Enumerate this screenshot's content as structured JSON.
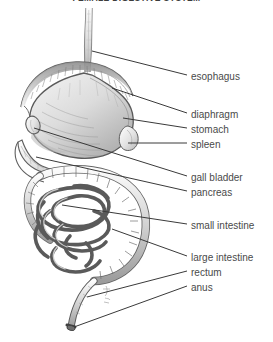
{
  "title": "FEMALE DIGESTIVE SYSTEM",
  "figure": {
    "alt_name": "digestive-system-diagram",
    "style": "pencil-shaded anatomical line drawing, grayscale",
    "ink_color": "#555555",
    "shade_color": "#9a9a9a",
    "background": "#ffffff"
  },
  "labels": [
    {
      "id": "esophagus",
      "text": "esophagus",
      "x": 191,
      "y": 78,
      "leader_from": [
        92,
        51
      ],
      "leader_to": [
        187,
        75
      ]
    },
    {
      "id": "diaphragm",
      "text": "diaphragm",
      "x": 191,
      "y": 116,
      "leader_from": [
        112,
        88
      ],
      "leader_to": [
        187,
        113
      ]
    },
    {
      "id": "stomach",
      "text": "stomach",
      "x": 191,
      "y": 131,
      "leader_from": [
        123,
        118
      ],
      "leader_to": [
        187,
        128
      ]
    },
    {
      "id": "spleen",
      "text": "spleen",
      "x": 191,
      "y": 146,
      "leader_from": [
        128,
        143
      ],
      "leader_to": [
        187,
        143
      ]
    },
    {
      "id": "gall-bladder",
      "text": "gall bladder",
      "x": 191,
      "y": 179,
      "leader_from": [
        34,
        128
      ],
      "leader_to": [
        187,
        176
      ]
    },
    {
      "id": "pancreas",
      "text": "pancreas",
      "x": 191,
      "y": 194,
      "leader_from": [
        36,
        157
      ],
      "leader_to": [
        187,
        191
      ]
    },
    {
      "id": "small-intestine",
      "text": "small intestine",
      "x": 191,
      "y": 227,
      "leader_from": [
        62,
        205
      ],
      "leader_to": [
        187,
        224
      ]
    },
    {
      "id": "large-intestine",
      "text": "large intestine",
      "x": 191,
      "y": 259,
      "leader_from": [
        112,
        229
      ],
      "leader_to": [
        187,
        256
      ]
    },
    {
      "id": "rectum",
      "text": "rectum",
      "x": 191,
      "y": 274,
      "leader_from": [
        87,
        297
      ],
      "leader_to": [
        187,
        271
      ]
    },
    {
      "id": "anus",
      "text": "anus",
      "x": 191,
      "y": 289,
      "leader_from": [
        74,
        327
      ],
      "leader_to": [
        187,
        286
      ]
    }
  ],
  "organs": [
    {
      "id": "esophagus",
      "name": "esophagus",
      "note": "narrow vertical tube descending from top of frame into stomach"
    },
    {
      "id": "diaphragm",
      "name": "diaphragm",
      "note": "wide shaded dome arc above the stomach"
    },
    {
      "id": "stomach",
      "name": "stomach",
      "note": "large shaded J-shaped sac below diaphragm"
    },
    {
      "id": "spleen",
      "name": "spleen",
      "note": "small oval at right of stomach"
    },
    {
      "id": "gall-bladder",
      "name": "gall bladder",
      "note": "small pear-shaped sac at upper left"
    },
    {
      "id": "pancreas",
      "name": "pancreas",
      "note": "elongated tapered gland behind stomach, left side"
    },
    {
      "id": "small-intestine",
      "name": "small intestine",
      "note": "dense tangled coils of narrow tubing in center"
    },
    {
      "id": "large-intestine",
      "name": "large intestine",
      "note": "wide haustrated tube framing the coils, right side"
    },
    {
      "id": "rectum",
      "name": "rectum",
      "note": "straight descending tube at bottom center"
    },
    {
      "id": "anus",
      "name": "anus",
      "note": "terminal opening at lower end of rectum"
    }
  ],
  "signature": {
    "present": true,
    "text": ""
  }
}
